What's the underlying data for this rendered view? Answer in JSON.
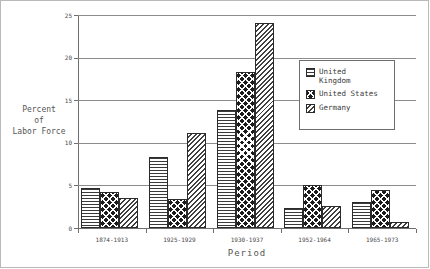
{
  "chart_data": {
    "type": "bar",
    "title": "",
    "xlabel": "Period",
    "ylabel": "Percent\nof\nLabor Force",
    "ylabel_lines": [
      "Percent",
      "of",
      "Labor Force"
    ],
    "categories": [
      "1874-1913",
      "1925-1929",
      "1930-1937",
      "1952-1964",
      "1965-1973"
    ],
    "series": [
      {
        "name": "United Kingdom",
        "pattern": "horizontal-lines",
        "values": [
          4.7,
          8.3,
          13.9,
          2.4,
          3.1
        ]
      },
      {
        "name": "United States",
        "pattern": "cross-hatch-dark",
        "values": [
          4.2,
          3.4,
          18.3,
          5.0,
          4.5
        ]
      },
      {
        "name": "Germany",
        "pattern": "diagonal-lines",
        "values": [
          3.5,
          11.1,
          24.1,
          2.6,
          0.7
        ]
      }
    ],
    "ylim": [
      0,
      25
    ],
    "yticks": [
      0,
      5,
      10,
      15,
      20,
      25
    ],
    "ytick_labels": [
      "0",
      "5",
      "10",
      "15",
      "20",
      "25"
    ],
    "grid": "horizontal",
    "legend_position": "upper-right-inside"
  },
  "axes": {
    "y_title_lines": [
      "Percent",
      "of",
      "Labor Force"
    ],
    "x_title": "Period"
  },
  "legend": {
    "entries": [
      {
        "label": "United\nKingdom"
      },
      {
        "label": "United States"
      },
      {
        "label": "Germany"
      }
    ]
  },
  "colors": {
    "grid": "#8c8c8c",
    "axis": "#6e6e6e",
    "text": "#4a4a4a",
    "bar_outline": "#2b2b2b",
    "background": "#ffffff"
  }
}
